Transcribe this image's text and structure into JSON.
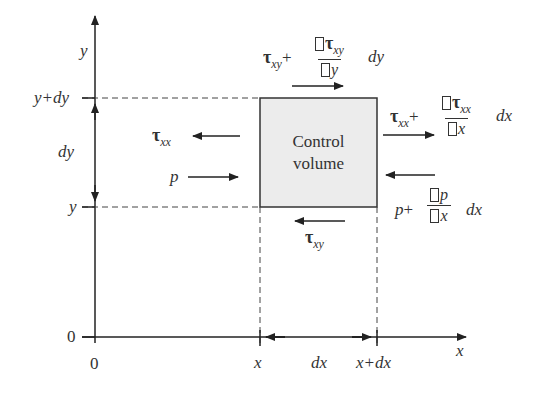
{
  "diagram": {
    "control_volume": {
      "label_line1": "Control",
      "label_line2": "volume",
      "fill": "#ececec"
    },
    "axes": {
      "y_axis_label": "y",
      "x_axis_label": "x",
      "origin_y_label": "0",
      "origin_x_label": "0"
    },
    "y_markers": {
      "top": "y+dy",
      "bottom": "y",
      "span": "dy"
    },
    "x_markers": {
      "left": "x",
      "right": "x+dx",
      "span": "dx"
    },
    "forces": {
      "left_tau": {
        "symbol": "τ",
        "sub": "xx"
      },
      "left_p": {
        "symbol": "p"
      },
      "bottom_tau": {
        "symbol": "τ",
        "sub": "xy"
      },
      "top_shear": {
        "base": "τ",
        "base_sub": "xy",
        "plus": "+",
        "num_sym": "τ",
        "num_sub": "xy",
        "den": "y",
        "tail": "dy"
      },
      "right_normal": {
        "base": "τ",
        "base_sub": "xx",
        "plus": "+",
        "num_sym": "τ",
        "num_sub": "xx",
        "den": "x",
        "tail": "dx"
      },
      "right_pressure": {
        "base": "p",
        "plus": "+",
        "num": "p",
        "den": "x",
        "tail": "dx"
      }
    }
  }
}
